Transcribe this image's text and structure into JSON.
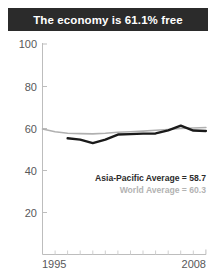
{
  "title": {
    "text": "The economy is 61.1% free"
  },
  "colors": {
    "banner_bg": "#2b2b2b",
    "banner_text": "#ffffff",
    "axis": "#b8b8b8",
    "tick_label": "#58585a",
    "country_line": "#1a1a1a",
    "world_line": "#b0b0b0",
    "legend_primary": "#2b2b2b",
    "legend_secondary": "#b3b3b3",
    "background": "#ffffff"
  },
  "legend": {
    "primary_label": "Asia-Pacific Average = 58.7",
    "secondary_label": "World Average = 60.3"
  },
  "axes": {
    "y_ticks": [
      "100",
      "80",
      "60",
      "40",
      "20"
    ],
    "x_start_label": "1995",
    "x_end_label": "2008"
  },
  "chart_data": {
    "type": "line",
    "title": "The economy is 61.1% free",
    "xlabel": "",
    "ylabel": "",
    "xlim": [
      1995,
      2008
    ],
    "ylim": [
      0,
      100
    ],
    "yticks": [
      20,
      40,
      60,
      80,
      100
    ],
    "xticks": [
      1995,
      1996,
      1997,
      1998,
      1999,
      2000,
      2001,
      2002,
      2003,
      2004,
      2005,
      2006,
      2007,
      2008
    ],
    "grid": false,
    "legend_position": "inside-lower-right",
    "x": [
      1995,
      1996,
      1997,
      1998,
      1999,
      2000,
      2001,
      2002,
      2003,
      2004,
      2005,
      2006,
      2007,
      2008
    ],
    "series": [
      {
        "name": "Asia-Pacific Average = 58.7",
        "color": "#1a1a1a",
        "width": 2.4,
        "values": [
          null,
          null,
          55.2,
          54.6,
          52.9,
          54.6,
          57.0,
          57.2,
          57.4,
          57.5,
          59.0,
          61.2,
          58.9,
          58.7
        ]
      },
      {
        "name": "World Average = 60.3",
        "color": "#b0b0b0",
        "width": 1.6,
        "values": [
          59.6,
          58.3,
          57.6,
          57.4,
          57.3,
          57.6,
          58.1,
          58.3,
          58.6,
          59.0,
          59.4,
          59.9,
          60.1,
          60.3
        ]
      }
    ],
    "annotations": [
      {
        "text": "Asia-Pacific Average = 58.7",
        "style": "bold-dark"
      },
      {
        "text": "World Average = 60.3",
        "style": "bold-gray"
      }
    ]
  }
}
